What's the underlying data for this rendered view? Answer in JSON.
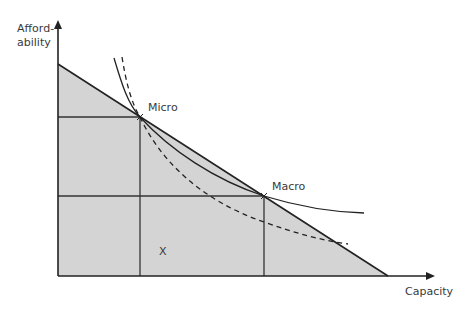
{
  "diagram": {
    "y_axis_label_line1": "Afford-",
    "y_axis_label_line2": "ability",
    "x_axis_label": "Capacity",
    "point_micro_label": "Micro",
    "point_macro_label": "Macro",
    "region_label": "X",
    "colors": {
      "fill": "#d4d4d4",
      "line": "#222222",
      "text": "#3a3a3a"
    }
  }
}
